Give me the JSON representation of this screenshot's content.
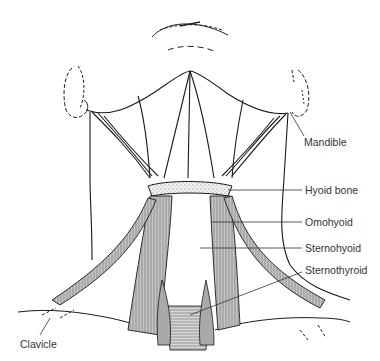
{
  "figure": {
    "line_color": "#1a1a1a",
    "muscle_fill": "#bdbdbd",
    "bone_fill": "#e8e8e8"
  },
  "labels": {
    "mandible": "Mandible",
    "hyoid_bone": "Hyoid bone",
    "omohyoid": "Omohyoid",
    "sternohyoid": "Sternohyoid",
    "sternothyroid": "Sternothyroid",
    "clavicle": "Clavicle"
  }
}
